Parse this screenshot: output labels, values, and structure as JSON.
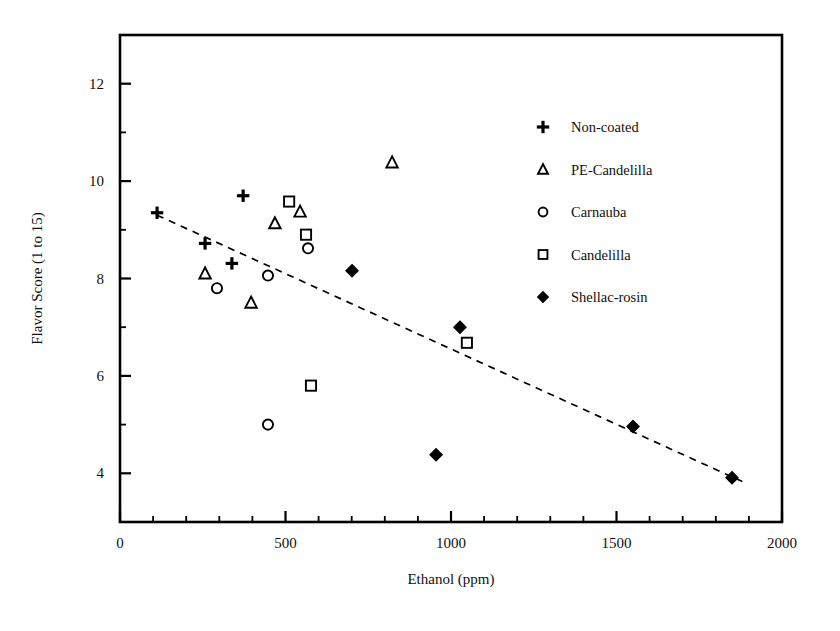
{
  "chart_data": {
    "type": "scatter",
    "title": "",
    "xlabel": "Ethanol (ppm)",
    "ylabel": "Flavor Score (1 to 15)",
    "xlim": [
      0,
      2000
    ],
    "ylim": [
      3.0,
      13.0
    ],
    "xticks": [
      0,
      500,
      1000,
      1500,
      2000
    ],
    "xtick_labels": [
      "0",
      "500",
      "1000",
      "1500",
      "2000"
    ],
    "yticks": [
      4,
      6,
      8,
      10,
      12
    ],
    "ytick_labels": [
      "4",
      "6",
      "8",
      "10",
      "12"
    ],
    "x_minor_tick_interval": 100,
    "y_minor_tick_interval": 1,
    "grid": false,
    "legend_position": "upper right",
    "series": [
      {
        "name": "Non-coated",
        "marker": "plus",
        "filled": true,
        "points": [
          {
            "x": 112,
            "y": 9.35
          },
          {
            "x": 257,
            "y": 8.72
          },
          {
            "x": 338,
            "y": 8.31
          },
          {
            "x": 372,
            "y": 9.7
          }
        ]
      },
      {
        "name": "PE-Candelilla",
        "marker": "triangle",
        "filled": false,
        "points": [
          {
            "x": 257,
            "y": 8.1
          },
          {
            "x": 396,
            "y": 7.5
          },
          {
            "x": 468,
            "y": 9.13
          },
          {
            "x": 544,
            "y": 9.37
          },
          {
            "x": 822,
            "y": 10.38
          }
        ]
      },
      {
        "name": "Carnauba",
        "marker": "circle",
        "filled": false,
        "points": [
          {
            "x": 293,
            "y": 7.8
          },
          {
            "x": 447,
            "y": 8.06
          },
          {
            "x": 447,
            "y": 5.0
          },
          {
            "x": 568,
            "y": 8.62
          }
        ]
      },
      {
        "name": "Candelilla",
        "marker": "square",
        "filled": false,
        "points": [
          {
            "x": 511,
            "y": 9.58
          },
          {
            "x": 562,
            "y": 8.9
          },
          {
            "x": 577,
            "y": 5.8
          },
          {
            "x": 1048,
            "y": 6.68
          }
        ]
      },
      {
        "name": "Shellac-rosin",
        "marker": "diamond",
        "filled": true,
        "points": [
          {
            "x": 701,
            "y": 8.16
          },
          {
            "x": 955,
            "y": 4.38
          },
          {
            "x": 1027,
            "y": 7.0
          },
          {
            "x": 1550,
            "y": 4.96
          },
          {
            "x": 1849,
            "y": 3.91
          }
        ]
      }
    ],
    "trendline": {
      "style": "dashed",
      "x_start": 112,
      "y_start": 9.3,
      "x_end": 1880,
      "y_end": 3.83
    }
  },
  "legend": {
    "entries": [
      {
        "label": "Non-coated",
        "marker": "plus"
      },
      {
        "label": "PE-Candelilla",
        "marker": "triangle"
      },
      {
        "label": "Carnauba",
        "marker": "circle"
      },
      {
        "label": "Candelilla",
        "marker": "square"
      },
      {
        "label": "Shellac-rosin",
        "marker": "diamond"
      }
    ]
  },
  "colors": {
    "foreground": "#000000",
    "background": "#ffffff"
  }
}
